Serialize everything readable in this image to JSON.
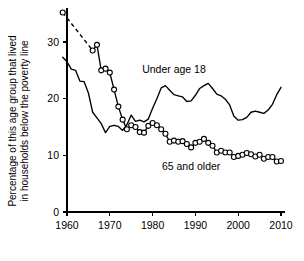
{
  "chart_data": {
    "type": "line",
    "title": "",
    "xlabel": "",
    "ylabel": "Percentage of this age group that lived in households below the poverty line",
    "ylabel_line1": "Percentage of this age group that lived",
    "ylabel_line2": "in households below the poverty line",
    "xlim": [
      1958,
      2011
    ],
    "ylim": [
      0,
      36
    ],
    "grid": false,
    "legend_position": "inline-annotations",
    "xticks": [
      1960,
      1970,
      1980,
      1990,
      2000,
      2010
    ],
    "xtick_labels": [
      "1960",
      "1970",
      "1980",
      "1990",
      "2000",
      "2010"
    ],
    "yticks": [
      0,
      10,
      20,
      30
    ],
    "ytick_labels": [
      "0",
      "10",
      "20",
      "30"
    ],
    "annotations": [
      {
        "text": "Under age 18",
        "x": 1985.0,
        "y": 24.6
      },
      {
        "text": "65 and older",
        "x": 1989.0,
        "y": 7.4
      }
    ],
    "series": [
      {
        "name": "Under age 18",
        "markers": false,
        "style": "solid",
        "x": [
          1959,
          1960,
          1961,
          1962,
          1963,
          1964,
          1965,
          1966,
          1967,
          1968,
          1969,
          1970,
          1971,
          1972,
          1973,
          1974,
          1975,
          1976,
          1977,
          1978,
          1979,
          1980,
          1981,
          1982,
          1983,
          1984,
          1985,
          1986,
          1987,
          1988,
          1989,
          1990,
          1991,
          1992,
          1993,
          1994,
          1995,
          1996,
          1997,
          1998,
          1999,
          2000,
          2001,
          2002,
          2003,
          2004,
          2005,
          2006,
          2007,
          2008,
          2009,
          2010
        ],
        "values": [
          27.3,
          26.5,
          25.2,
          25.0,
          23.1,
          23.0,
          21.0,
          17.6,
          16.6,
          15.6,
          14.0,
          15.1,
          15.3,
          15.1,
          14.4,
          15.4,
          17.1,
          16.0,
          16.2,
          15.9,
          16.4,
          18.3,
          20.0,
          21.9,
          22.3,
          21.5,
          20.7,
          20.5,
          20.3,
          19.5,
          19.6,
          20.6,
          21.8,
          22.3,
          22.7,
          21.8,
          20.8,
          20.5,
          19.9,
          18.9,
          16.9,
          16.2,
          16.3,
          16.7,
          17.6,
          17.8,
          17.6,
          17.4,
          18.0,
          19.0,
          20.7,
          22.0
        ]
      },
      {
        "name": "65 and older",
        "markers": true,
        "style": "solid-with-leading-dash",
        "dash_gap_between": [
          1959,
          1966
        ],
        "x": [
          1959,
          1966,
          1967,
          1968,
          1969,
          1970,
          1971,
          1972,
          1973,
          1974,
          1975,
          1976,
          1977,
          1978,
          1979,
          1980,
          1981,
          1982,
          1983,
          1984,
          1985,
          1986,
          1987,
          1988,
          1989,
          1990,
          1991,
          1992,
          1993,
          1994,
          1995,
          1996,
          1997,
          1998,
          1999,
          2000,
          2001,
          2002,
          2003,
          2004,
          2005,
          2006,
          2007,
          2008,
          2009,
          2010
        ],
        "values": [
          35.2,
          28.5,
          29.5,
          25.0,
          25.3,
          24.6,
          21.6,
          18.6,
          16.3,
          14.6,
          15.3,
          15.0,
          14.1,
          14.0,
          15.2,
          15.7,
          15.3,
          14.6,
          13.8,
          12.4,
          12.6,
          12.4,
          12.5,
          12.0,
          11.4,
          12.2,
          12.4,
          12.9,
          12.2,
          11.7,
          10.5,
          10.8,
          10.5,
          10.5,
          9.7,
          9.9,
          10.1,
          10.4,
          10.2,
          9.8,
          10.1,
          9.4,
          9.7,
          9.7,
          8.9,
          9.0
        ]
      }
    ]
  }
}
